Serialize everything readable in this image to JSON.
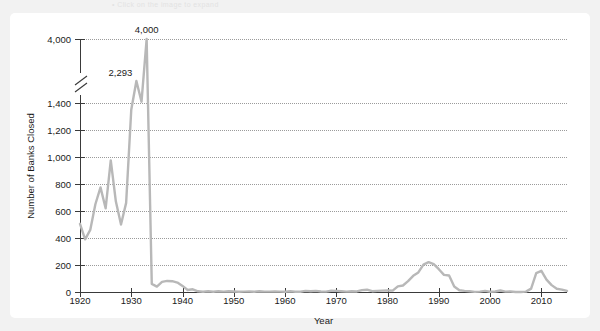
{
  "header": {
    "ghost_text": "• Click on the image to expand"
  },
  "chart_data": {
    "type": "line",
    "title": "",
    "xlabel": "Year",
    "ylabel": "Number of Banks Closed",
    "grid": true,
    "legend": "none",
    "line_color": "#b8b8b8",
    "axis_color": "#3a3a3a",
    "gridline_color": "#9b9b9b",
    "xlim": [
      1920,
      2015
    ],
    "xticks": [
      1920,
      1930,
      1940,
      1950,
      1960,
      1970,
      1980,
      1990,
      2000,
      2010
    ],
    "xtick_labels": [
      "1920",
      "1930",
      "1940",
      "1950",
      "1960",
      "1970",
      "1980",
      "1990",
      "2000",
      "2010"
    ],
    "ylim": [
      0,
      4000
    ],
    "yticks": [
      0,
      200,
      400,
      600,
      800,
      1000,
      1200,
      1400,
      4000
    ],
    "ytick_labels": [
      "0",
      "200",
      "400",
      "600",
      "800",
      "1,000",
      "1,200",
      "1,400",
      "4,000"
    ],
    "y_axis_break": {
      "between": [
        1400,
        4000
      ],
      "note": "broken axis"
    },
    "annotations": [
      {
        "label": "4,000",
        "x": 1933,
        "y": 4000
      },
      {
        "label": "2,293",
        "x": 1931,
        "y": 2293
      }
    ],
    "x": [
      1920,
      1921,
      1922,
      1923,
      1924,
      1925,
      1926,
      1927,
      1928,
      1929,
      1930,
      1931,
      1932,
      1933,
      1934,
      1935,
      1936,
      1937,
      1938,
      1939,
      1940,
      1941,
      1942,
      1943,
      1944,
      1945,
      1946,
      1947,
      1948,
      1949,
      1950,
      1951,
      1952,
      1953,
      1954,
      1955,
      1956,
      1957,
      1958,
      1959,
      1960,
      1961,
      1962,
      1963,
      1964,
      1965,
      1966,
      1967,
      1968,
      1969,
      1970,
      1971,
      1972,
      1973,
      1974,
      1975,
      1976,
      1977,
      1978,
      1979,
      1980,
      1981,
      1982,
      1983,
      1984,
      1985,
      1986,
      1987,
      1988,
      1989,
      1990,
      1991,
      1992,
      1993,
      1994,
      1995,
      1996,
      1997,
      1998,
      1999,
      2000,
      2001,
      2002,
      2003,
      2004,
      2005,
      2006,
      2007,
      2008,
      2009,
      2010,
      2011,
      2012,
      2013,
      2014,
      2015
    ],
    "values": [
      505,
      390,
      460,
      650,
      775,
      620,
      975,
      670,
      500,
      660,
      1350,
      2293,
      1453,
      4000,
      60,
      40,
      75,
      82,
      80,
      70,
      45,
      15,
      20,
      5,
      2,
      5,
      2,
      5,
      3,
      5,
      4,
      2,
      3,
      4,
      2,
      5,
      3,
      3,
      4,
      3,
      2,
      5,
      2,
      2,
      8,
      5,
      8,
      4,
      3,
      9,
      8,
      6,
      3,
      6,
      4,
      14,
      17,
      6,
      8,
      10,
      11,
      10,
      42,
      48,
      80,
      120,
      145,
      203,
      221,
      207,
      169,
      127,
      122,
      41,
      13,
      8,
      6,
      1,
      3,
      8,
      2,
      4,
      11,
      3,
      4,
      0,
      0,
      3,
      25,
      140,
      157,
      92,
      51,
      24,
      18,
      8
    ],
    "notes": {
      "peak_1933": 4000,
      "peak_1931": 2293,
      "s_and_l_peak_1989": 203,
      "financial_crisis_peak_2010": 157
    }
  }
}
